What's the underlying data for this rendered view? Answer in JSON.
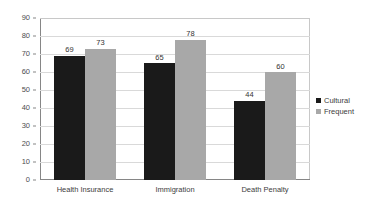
{
  "chart_data": {
    "type": "bar",
    "title": "",
    "subtitle": "",
    "xlabel": "",
    "ylabel": "",
    "ylim": [
      0,
      90
    ],
    "ytick_step": 10,
    "yticks": [
      90,
      80,
      70,
      60,
      50,
      40,
      30,
      20,
      10,
      0
    ],
    "grid": true,
    "legend_position": "right",
    "categories": [
      "Health Insurance",
      "Immigration",
      "Death Penalty"
    ],
    "series": [
      {
        "name": "Cultural",
        "color": "#1a1a1a",
        "values": [
          69,
          65,
          44
        ]
      },
      {
        "name": "Frequent",
        "color": "#a8a8a8",
        "values": [
          73,
          78,
          60
        ]
      }
    ],
    "data_labels": [
      [
        "69",
        "73"
      ],
      [
        "65",
        "78"
      ],
      [
        "44",
        "60"
      ]
    ]
  },
  "axis": {
    "y_tick_labels": [
      "90",
      "80",
      "70",
      "60",
      "50",
      "40",
      "30",
      "20",
      "10",
      "0"
    ],
    "x_tick_labels": [
      "Health Insurance",
      "Immigration",
      "Death Penalty"
    ]
  },
  "legend": {
    "items": [
      {
        "label": "Cultural",
        "color": "#1a1a1a"
      },
      {
        "label": "Frequent",
        "color": "#a8a8a8"
      }
    ]
  },
  "colors": {
    "series_cultural": "#1a1a1a",
    "series_frequent": "#a8a8a8",
    "gridline": "#d9d9d9",
    "axis": "#868686",
    "background": "#ffffff",
    "text": "#3d3d3d"
  }
}
